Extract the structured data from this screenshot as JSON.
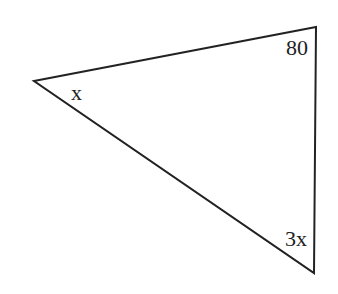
{
  "diagram": {
    "type": "triangle",
    "stroke_color": "#222222",
    "background": "#ffffff",
    "vertices": {
      "left": {
        "x": 34,
        "y": 81
      },
      "top_right": {
        "x": 316,
        "y": 27
      },
      "bottom_right": {
        "x": 314,
        "y": 273
      }
    },
    "angle_labels": {
      "left": "x",
      "top_right": "80",
      "bottom_right": "3x"
    }
  }
}
